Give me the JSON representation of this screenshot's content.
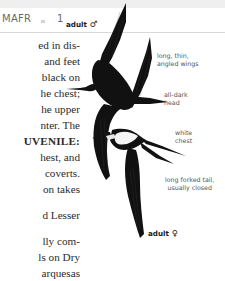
{
  "header": {
    "section_code": "MAFR",
    "page_number": "1"
  },
  "body_text": {
    "lines": [
      "ed in dis-",
      "and feet",
      "black on",
      "he chest;",
      "he upper",
      "nter. The",
      "UVENILE:",
      "hest, and",
      "coverts.",
      "on takes",
      "",
      "d Lesser",
      "",
      "lly com-",
      "ls on Dry",
      "arquesas"
    ]
  },
  "illustration": {
    "subject": "frigatebird pair in flight",
    "labels": {
      "male": {
        "text": "adult",
        "symbol": "♂"
      },
      "female": {
        "text": "adult",
        "symbol": "♀"
      },
      "wings": [
        "long, thin,",
        "angled wings"
      ],
      "head": [
        "all-dark",
        "head"
      ],
      "chest": [
        "white",
        "chest"
      ],
      "tail": [
        "long forked tail,",
        "usually closed"
      ]
    }
  }
}
